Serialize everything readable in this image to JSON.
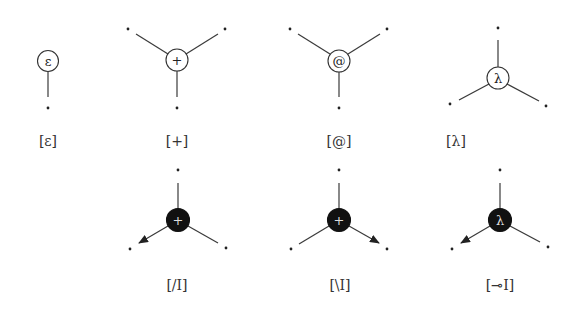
{
  "diagram": {
    "rows": [
      {
        "nodes": [
          {
            "id": "epsilon",
            "symbol": "ε",
            "label": "[ε]",
            "style": "white"
          },
          {
            "id": "plus",
            "symbol": "+",
            "label": "[+]",
            "style": "white"
          },
          {
            "id": "at",
            "symbol": "@",
            "label": "[@]",
            "style": "white"
          },
          {
            "id": "lambda",
            "symbol": "λ",
            "label": "[λ]",
            "style": "white"
          }
        ]
      },
      {
        "nodes": [
          {
            "id": "slash-intro",
            "symbol": "+",
            "label": "[/I]",
            "style": "black",
            "arrow": "bottom-left"
          },
          {
            "id": "backslash-intro",
            "symbol": "+",
            "label": "[\\I]",
            "style": "black",
            "arrow": "bottom-right"
          },
          {
            "id": "lollipop-intro",
            "symbol": "λ",
            "label": "[⊸I]",
            "style": "black",
            "arrow": "bottom-left"
          }
        ]
      }
    ]
  }
}
